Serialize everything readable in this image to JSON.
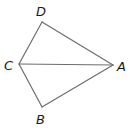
{
  "diagram": {
    "type": "quadrilateral-with-diagonal",
    "stroke_color": "#6d6d6d",
    "label_color": "#1a1a1a",
    "points": {
      "A": {
        "label": "A",
        "x": 113,
        "y": 65,
        "lx": 117,
        "ly": 71
      },
      "B": {
        "label": "B",
        "x": 42,
        "y": 107,
        "lx": 36,
        "ly": 124
      },
      "C": {
        "label": "C",
        "x": 19,
        "y": 64,
        "lx": 4,
        "ly": 70
      },
      "D": {
        "label": "D",
        "x": 42,
        "y": 22,
        "lx": 36,
        "ly": 16
      }
    },
    "edges": [
      [
        "D",
        "A"
      ],
      [
        "A",
        "B"
      ],
      [
        "B",
        "C"
      ],
      [
        "C",
        "D"
      ],
      [
        "C",
        "A"
      ]
    ]
  }
}
